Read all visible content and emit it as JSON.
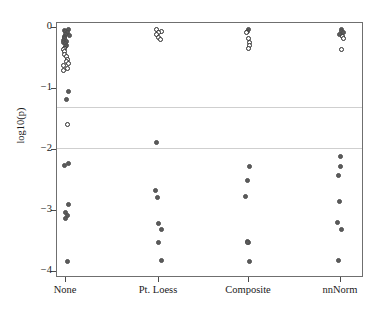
{
  "chart_data": {
    "type": "scatter",
    "title": "",
    "xlabel": "",
    "ylabel": "log10(p)",
    "grid": true,
    "gridlines_y": [
      -1.3,
      -1.97
    ],
    "legend": null,
    "xlim": [
      0,
      5
    ],
    "ylim": [
      -4.18,
      0.09
    ],
    "categories": [
      "None",
      "Pt. Loess",
      "Composite",
      "nnNorm"
    ],
    "ytick_labels": [
      "0",
      "-1",
      "-2",
      "-3",
      "-4"
    ],
    "ytick_values": [
      0,
      -1,
      -2,
      -3,
      -4
    ],
    "marker_styles": {
      "open": "non-significant (open circle)",
      "filled": "significant (filled circle)"
    },
    "series": [
      {
        "name": "None",
        "x_category": "None",
        "points": [
          {
            "y": -0.02,
            "style": "filled"
          },
          {
            "y": -0.04,
            "style": "filled"
          },
          {
            "y": -0.06,
            "style": "filled"
          },
          {
            "y": -0.08,
            "style": "filled"
          },
          {
            "y": -0.1,
            "style": "filled"
          },
          {
            "y": -0.12,
            "style": "filled"
          },
          {
            "y": -0.14,
            "style": "filled"
          },
          {
            "y": -0.16,
            "style": "filled"
          },
          {
            "y": -0.18,
            "style": "filled"
          },
          {
            "y": -0.2,
            "style": "filled"
          },
          {
            "y": -0.22,
            "style": "filled"
          },
          {
            "y": -0.24,
            "style": "filled"
          },
          {
            "y": -0.26,
            "style": "filled"
          },
          {
            "y": -0.28,
            "style": "filled"
          },
          {
            "y": -0.3,
            "style": "filled"
          },
          {
            "y": -0.33,
            "style": "open"
          },
          {
            "y": -0.36,
            "style": "open"
          },
          {
            "y": -0.39,
            "style": "open"
          },
          {
            "y": -0.43,
            "style": "open"
          },
          {
            "y": -0.47,
            "style": "open"
          },
          {
            "y": -0.51,
            "style": "open"
          },
          {
            "y": -0.55,
            "style": "open"
          },
          {
            "y": -0.58,
            "style": "open"
          },
          {
            "y": -0.62,
            "style": "open"
          },
          {
            "y": -0.66,
            "style": "open"
          },
          {
            "y": -0.7,
            "style": "open"
          },
          {
            "y": -1.04,
            "style": "filled"
          },
          {
            "y": -1.17,
            "style": "filled"
          },
          {
            "y": -1.59,
            "style": "open"
          },
          {
            "y": -2.22,
            "style": "filled"
          },
          {
            "y": -2.26,
            "style": "filled"
          },
          {
            "y": -2.9,
            "style": "filled"
          },
          {
            "y": -3.02,
            "style": "filled"
          },
          {
            "y": -3.08,
            "style": "filled"
          },
          {
            "y": -3.12,
            "style": "filled"
          },
          {
            "y": -3.83,
            "style": "filled"
          }
        ]
      },
      {
        "name": "Pt. Loess",
        "x_category": "Pt. Loess",
        "points": [
          {
            "y": -0.02,
            "style": "open"
          },
          {
            "y": -0.05,
            "style": "open"
          },
          {
            "y": -0.08,
            "style": "open"
          },
          {
            "y": -0.11,
            "style": "open"
          },
          {
            "y": -0.16,
            "style": "open"
          },
          {
            "y": -0.19,
            "style": "open"
          },
          {
            "y": -1.88,
            "style": "filled"
          },
          {
            "y": -2.67,
            "style": "filled"
          },
          {
            "y": -2.78,
            "style": "filled"
          },
          {
            "y": -3.2,
            "style": "filled"
          },
          {
            "y": -3.31,
            "style": "filled"
          },
          {
            "y": -3.52,
            "style": "filled"
          },
          {
            "y": -3.81,
            "style": "filled"
          }
        ]
      },
      {
        "name": "Composite",
        "x_category": "Composite",
        "points": [
          {
            "y": -0.02,
            "style": "filled"
          },
          {
            "y": -0.05,
            "style": "filled"
          },
          {
            "y": -0.08,
            "style": "open"
          },
          {
            "y": -0.18,
            "style": "open"
          },
          {
            "y": -0.24,
            "style": "open"
          },
          {
            "y": -0.29,
            "style": "open"
          },
          {
            "y": -0.33,
            "style": "open"
          },
          {
            "y": -2.27,
            "style": "filled"
          },
          {
            "y": -2.5,
            "style": "filled"
          },
          {
            "y": -2.77,
            "style": "filled"
          },
          {
            "y": -3.5,
            "style": "filled"
          },
          {
            "y": -3.51,
            "style": "filled"
          },
          {
            "y": -3.52,
            "style": "filled"
          },
          {
            "y": -3.82,
            "style": "filled"
          }
        ]
      },
      {
        "name": "nnNorm",
        "x_category": "nnNorm",
        "points": [
          {
            "y": -0.02,
            "style": "filled"
          },
          {
            "y": -0.05,
            "style": "filled"
          },
          {
            "y": -0.08,
            "style": "filled"
          },
          {
            "y": -0.11,
            "style": "filled"
          },
          {
            "y": -0.14,
            "style": "open"
          },
          {
            "y": -0.18,
            "style": "open"
          },
          {
            "y": -0.35,
            "style": "open"
          },
          {
            "y": -2.1,
            "style": "filled"
          },
          {
            "y": -2.27,
            "style": "filled"
          },
          {
            "y": -2.41,
            "style": "filled"
          },
          {
            "y": -2.85,
            "style": "filled"
          },
          {
            "y": -3.19,
            "style": "filled"
          },
          {
            "y": -3.31,
            "style": "filled"
          },
          {
            "y": -3.81,
            "style": "filled"
          }
        ]
      }
    ]
  }
}
